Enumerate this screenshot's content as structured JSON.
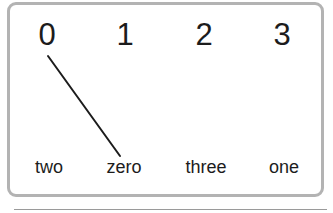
{
  "diagram": {
    "numbers": [
      {
        "label": "0",
        "x": 47
      },
      {
        "label": "1",
        "x": 125
      },
      {
        "label": "2",
        "x": 204
      },
      {
        "label": "3",
        "x": 282
      }
    ],
    "words": [
      {
        "label": "two",
        "x": 49
      },
      {
        "label": "zero",
        "x": 124
      },
      {
        "label": "three",
        "x": 206
      },
      {
        "label": "one",
        "x": 284
      }
    ],
    "connections": [
      {
        "from": "0",
        "to": "zero",
        "x1": 48,
        "y1": 56,
        "x2": 120,
        "y2": 156
      }
    ],
    "colors": {
      "border": "#b3b3b3",
      "text": "#1c1c1c",
      "line": "#1c1c1c"
    }
  }
}
